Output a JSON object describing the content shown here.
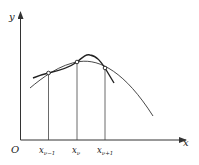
{
  "diagram": {
    "axes": {
      "x_label": "x",
      "y_label": "y",
      "origin_label": "O"
    },
    "ticks": [
      {
        "base": "x",
        "sub": "ν−1"
      },
      {
        "base": "x",
        "sub": "ν"
      },
      {
        "base": "x",
        "sub": "ν+1"
      }
    ],
    "curves": [
      {
        "name": "function-curve",
        "style": "thin"
      },
      {
        "name": "interpolating-curve",
        "style": "thick"
      }
    ],
    "colors": {
      "stroke": "#333333",
      "background": "#ffffff"
    }
  }
}
